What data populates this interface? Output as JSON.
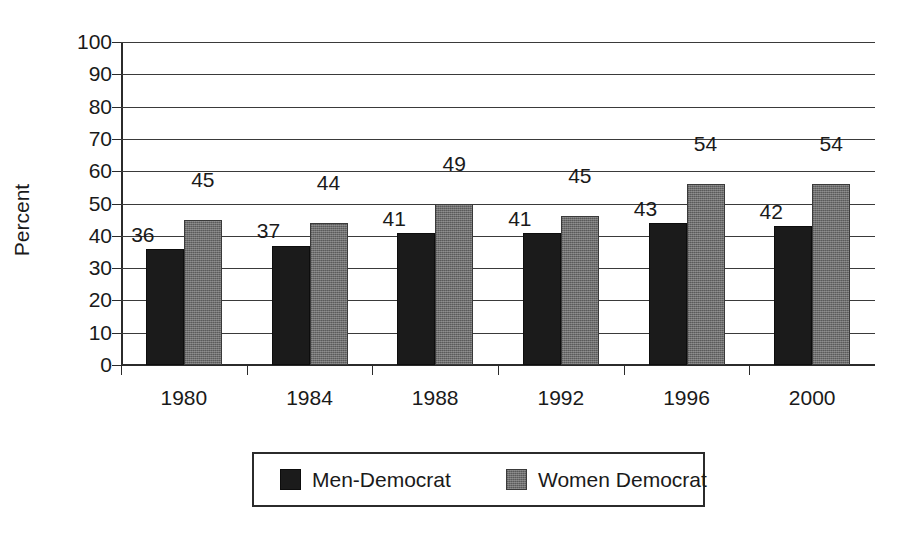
{
  "chart_data": {
    "type": "bar",
    "title": "",
    "xlabel": "",
    "ylabel": "Percent",
    "ylim": [
      0,
      100
    ],
    "ytick_step": 10,
    "yticks": [
      "0",
      "10",
      "20",
      "30",
      "40",
      "50",
      "60",
      "70",
      "80",
      "90",
      "100"
    ],
    "grid": "horizontal",
    "legend_position": "bottom-center",
    "categories": [
      "1980",
      "1984",
      "1988",
      "1992",
      "1996",
      "2000"
    ],
    "series": [
      {
        "name": "Men-Democrat",
        "color": "#1b1b1b",
        "values": [
          36,
          37,
          41,
          41,
          43,
          42
        ],
        "drawn_heights": [
          36,
          37,
          41,
          41,
          44,
          43
        ]
      },
      {
        "name": "Women Democrat",
        "color": "#6e6e6e",
        "values": [
          45,
          44,
          49,
          45,
          54,
          54
        ],
        "drawn_heights": [
          45,
          44,
          50,
          46,
          56,
          56
        ]
      }
    ],
    "value_labels": [
      {
        "series": 0,
        "category": "1980",
        "text": "36"
      },
      {
        "series": 1,
        "category": "1980",
        "text": "45"
      },
      {
        "series": 0,
        "category": "1984",
        "text": "37"
      },
      {
        "series": 1,
        "category": "1984",
        "text": "44"
      },
      {
        "series": 0,
        "category": "1988",
        "text": "41"
      },
      {
        "series": 1,
        "category": "1988",
        "text": "49"
      },
      {
        "series": 0,
        "category": "1992",
        "text": "41"
      },
      {
        "series": 1,
        "category": "1992",
        "text": "45"
      },
      {
        "series": 0,
        "category": "1996",
        "text": "43"
      },
      {
        "series": 1,
        "category": "1996",
        "text": "54"
      },
      {
        "series": 0,
        "category": "2000",
        "text": "42"
      },
      {
        "series": 1,
        "category": "2000",
        "text": "54"
      }
    ]
  },
  "legend": {
    "items": [
      {
        "label": "Men-Democrat",
        "swatch": "men"
      },
      {
        "label": "Women Democrat",
        "swatch": "women"
      }
    ]
  },
  "colors": {
    "men_bar": "#1b1b1b",
    "women_bar": "#6e6e6e",
    "axis": "#2b2b2b",
    "grid": "#3a3a3a",
    "background": "#ffffff",
    "text": "#1a1a1a"
  }
}
